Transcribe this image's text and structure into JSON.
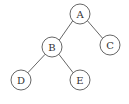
{
  "diagram": {
    "type": "binary-tree",
    "node_radius": 10,
    "colors": {
      "stroke": "#555555",
      "fill": "#ffffff",
      "text": "#333333",
      "background": "#ffffff"
    },
    "nodes": [
      {
        "id": "A",
        "label": "A",
        "x": 80,
        "y": 14
      },
      {
        "id": "B",
        "label": "B",
        "x": 52,
        "y": 47
      },
      {
        "id": "C",
        "label": "C",
        "x": 110,
        "y": 45
      },
      {
        "id": "D",
        "label": "D",
        "x": 21,
        "y": 80
      },
      {
        "id": "E",
        "label": "E",
        "x": 80,
        "y": 80
      }
    ],
    "edges": [
      {
        "from": "A",
        "to": "B"
      },
      {
        "from": "A",
        "to": "C"
      },
      {
        "from": "B",
        "to": "D"
      },
      {
        "from": "B",
        "to": "E"
      }
    ]
  }
}
